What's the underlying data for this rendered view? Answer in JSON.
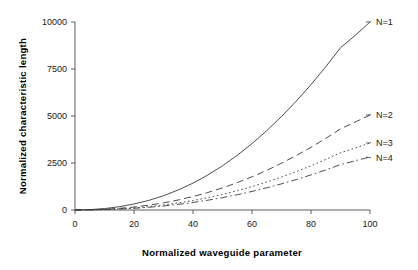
{
  "chart_data": {
    "type": "line",
    "title": "",
    "xlabel": "Normalized waveguide parameter",
    "ylabel": "Normalized characteristic length",
    "xlim": [
      0,
      100
    ],
    "ylim": [
      0,
      10000
    ],
    "xticks": [
      0,
      20,
      40,
      60,
      80,
      100
    ],
    "yticks": [
      0,
      2500,
      5000,
      7500,
      10000
    ],
    "xtick_labels": [
      "0",
      "20",
      "40",
      "60",
      "80",
      "100"
    ],
    "ytick_labels": [
      "0",
      "2500",
      "5000",
      "7500",
      "10000"
    ],
    "grid": false,
    "legend_position": "right-of-curve-ends",
    "x": [
      0,
      5,
      10,
      15,
      20,
      25,
      30,
      35,
      40,
      45,
      50,
      55,
      60,
      65,
      70,
      75,
      80,
      85,
      90,
      95,
      100
    ],
    "series": [
      {
        "name": "N=1",
        "label": "N=1",
        "linestyle": "solid",
        "color": "#3a3a3a",
        "values": [
          0,
          20,
          75,
          175,
          320,
          510,
          760,
          1065,
          1430,
          1860,
          2350,
          2910,
          3530,
          4220,
          4970,
          5790,
          6670,
          7620,
          8630,
          9290,
          10000
        ]
      },
      {
        "name": "N=2",
        "label": "N=2",
        "linestyle": "dashed",
        "color": "#3a3a3a",
        "values": [
          0,
          10,
          38,
          88,
          160,
          256,
          380,
          533,
          715,
          930,
          1175,
          1455,
          1765,
          2110,
          2485,
          2895,
          3335,
          3810,
          4315,
          4680,
          5050
        ]
      },
      {
        "name": "N=3",
        "label": "N=3",
        "linestyle": "dotted",
        "color": "#3a3a3a",
        "values": [
          0,
          7,
          27,
          62,
          113,
          180,
          268,
          376,
          504,
          656,
          829,
          1026,
          1245,
          1488,
          1753,
          2042,
          2352,
          2687,
          3043,
          3300,
          3560
        ]
      },
      {
        "name": "N=4",
        "label": "N=4",
        "linestyle": "dashdot",
        "color": "#3a3a3a",
        "values": [
          0,
          6,
          21,
          49,
          90,
          143,
          213,
          298,
          400,
          520,
          658,
          814,
          988,
          1181,
          1391,
          1620,
          1866,
          2132,
          2414,
          2620,
          2820
        ]
      }
    ],
    "series_label_positions": [
      {
        "name": "N=1",
        "x_px": 376,
        "y_px": 25
      },
      {
        "name": "N=2",
        "x_px": 376,
        "y_px": 118
      },
      {
        "name": "N=3",
        "x_px": 376,
        "y_px": 146
      },
      {
        "name": "N=4",
        "x_px": 376,
        "y_px": 161
      }
    ]
  }
}
